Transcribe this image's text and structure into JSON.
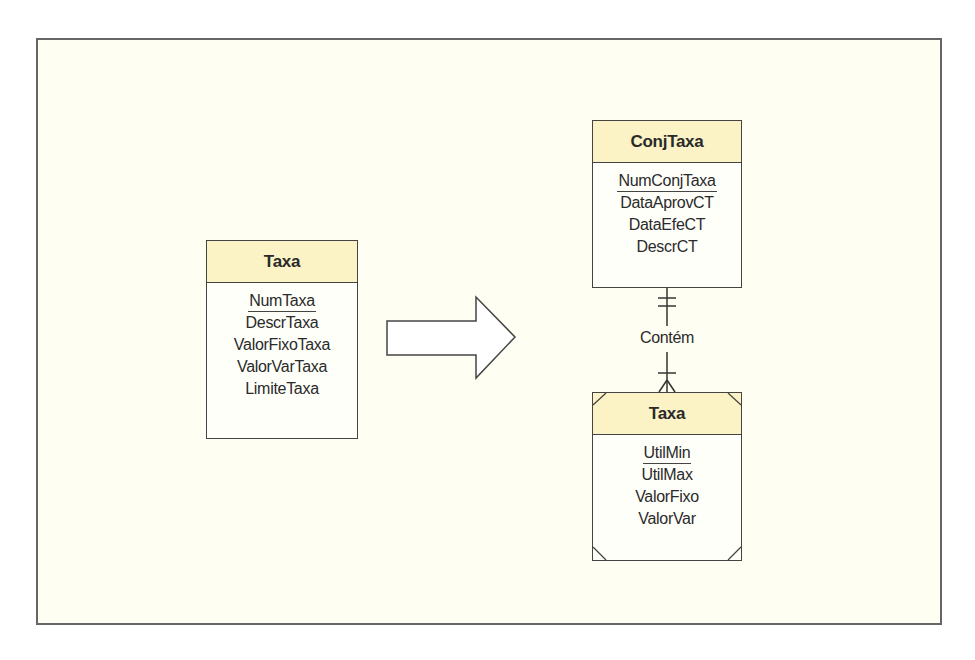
{
  "diagram": {
    "source_entity": {
      "name": "Taxa",
      "primary_key": "NumTaxa",
      "attributes": [
        "DescrTaxa",
        "ValorFixoTaxa",
        "ValorVarTaxa",
        "LimiteTaxa"
      ]
    },
    "transform_arrow": "arrow-right",
    "parent_entity": {
      "name": "ConjTaxa",
      "primary_key": "NumConjTaxa",
      "attributes": [
        "DataAprovCT",
        "DataEfeCT",
        "DescrCT"
      ]
    },
    "relationship": {
      "label": "Contém",
      "parent_cardinality": "exactly-one",
      "child_cardinality": "one-or-many"
    },
    "weak_entity": {
      "name": "Taxa",
      "primary_key": "UtilMin",
      "attributes": [
        "UtilMax",
        "ValorFixo",
        "ValorVar"
      ]
    },
    "colors": {
      "header_fill": "#fbf3c6",
      "frame_background": "#fefef2",
      "line": "#444444"
    }
  }
}
